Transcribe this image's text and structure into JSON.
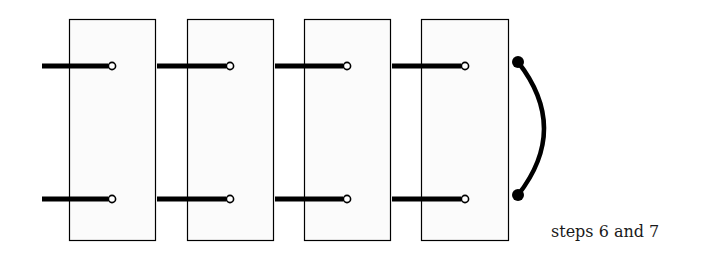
{
  "caption": "steps 6 and 7",
  "boxes": [
    {
      "x": 69,
      "y": 19,
      "w": 86,
      "h": 221
    },
    {
      "x": 187,
      "y": 19,
      "w": 86,
      "h": 221
    },
    {
      "x": 304,
      "y": 19,
      "w": 86,
      "h": 221
    },
    {
      "x": 421,
      "y": 19,
      "w": 87,
      "h": 221
    }
  ],
  "rods": {
    "rows_y": [
      66,
      199
    ],
    "segments": [
      {
        "x1": 42,
        "x2": 112
      },
      {
        "x1": 157,
        "x2": 230
      },
      {
        "x1": 275,
        "x2": 347
      },
      {
        "x1": 392,
        "x2": 465
      }
    ]
  },
  "connector": {
    "x": 518,
    "y_top": 62,
    "y_bottom": 195,
    "bulge_x": 552
  },
  "colors": {
    "box_fill": "#fbfbfb",
    "stroke": "#000000"
  }
}
